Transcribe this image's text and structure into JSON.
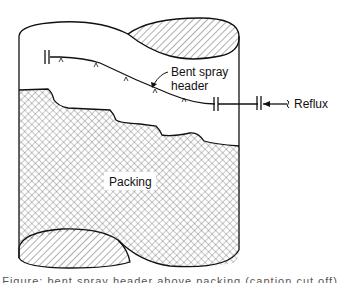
{
  "figure": {
    "labels": {
      "spray_header_line1": "Bent spray",
      "spray_header_line2": "header",
      "reflux": "Reflux",
      "packing": "Packing"
    },
    "caption_cutoff": "Figure: bent spray header above packing (caption cut off)"
  }
}
